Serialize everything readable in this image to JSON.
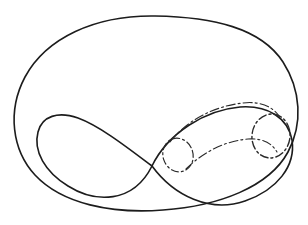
{
  "figure": {
    "background_color": "#ffffff",
    "ink_color": "#1c1c1c",
    "accent_color": "#2a2a2a",
    "canvas": {
      "width": 308,
      "height": 225
    }
  },
  "shapes": {
    "outer_oval": {
      "name": "outer-boundary-oval",
      "style": "solid",
      "stroke_width": 1.6,
      "stroke_color": "#1c1c1c",
      "path": "M 155 16 C 95 15 46 38 25 77 C 7 111 12 150 35 175 C 62 204 112 214 163 210 C 219 206 269 187 288 152 C 303 124 301 90 283 62 C 261 28 213 17 155 16 Z"
    },
    "figure_eight": {
      "name": "figure-eight-curve",
      "style": "solid",
      "stroke_width": 1.6,
      "stroke_color": "#1c1c1c",
      "path": "M 152 166 C 128 148 100 126 78 118 C 58 111 42 116 38 132 C 33 151 45 172 68 186 C 95 203 133 204 152 166 C 168 133 205 110 240 107 C 268 105 288 118 292 140 C 296 166 277 190 245 201 C 210 213 174 196 152 166 Z"
    },
    "tube_upper_edge": {
      "name": "tube-upper-boundary",
      "style": "dash-dot",
      "stroke_width": 1.1,
      "stroke_color": "#2a2a2a",
      "dash_pattern": "9 3 2 3",
      "path": "M 170 142 C 186 121 214 106 243 103 C 259 101 272 106 279 116"
    },
    "tube_lower_edge": {
      "name": "tube-lower-boundary",
      "style": "dash-dot",
      "stroke_width": 1.1,
      "stroke_color": "#2a2a2a",
      "dash_pattern": "9 3 2 3",
      "path": "M 186 169 C 203 152 225 141 248 139 C 262 138 272 143 277 152"
    },
    "left_disk": {
      "name": "left-cross-section-disk",
      "style": "dash-dot",
      "stroke_width": 1.2,
      "stroke_color": "#2a2a2a",
      "dash_pattern": "7 3 2 3",
      "center": [
        178,
        155
      ],
      "radius_x": 15,
      "radius_y": 17,
      "rotation_deg": -18
    },
    "right_disk": {
      "name": "right-cross-section-disk",
      "style": "dash-dot",
      "stroke_width": 1.4,
      "stroke_color": "#2a2a2a",
      "dash_pattern": "8 3 2 3",
      "center": [
        271,
        136
      ],
      "radius_x": 19,
      "radius_y": 22,
      "rotation_deg": 8
    }
  },
  "labels": []
}
